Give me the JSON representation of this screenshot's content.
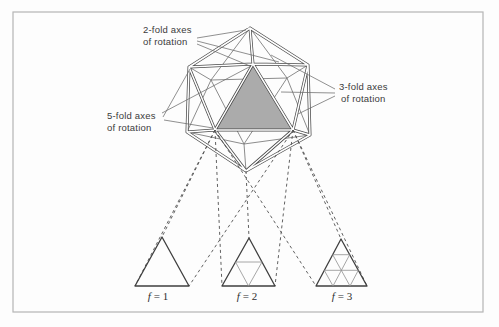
{
  "figure": {
    "annotations": {
      "twofold": {
        "line1": "2-fold axes",
        "line2": "of rotation"
      },
      "fivefold": {
        "line1": "5-fold axes",
        "line2": "of rotation"
      },
      "threefold": {
        "line1": "3-fold axes",
        "line2": "of rotation"
      }
    },
    "facet_labels": [
      {
        "symbol": "f",
        "eq": "= 1"
      },
      {
        "symbol": "f",
        "eq": "= 2"
      },
      {
        "symbol": "f",
        "eq": "= 3"
      }
    ],
    "colors": {
      "face_fill": "#ababab",
      "edge": "#4a4a4a",
      "border": "#b5b5b5",
      "background": "#fdfdfd"
    }
  }
}
